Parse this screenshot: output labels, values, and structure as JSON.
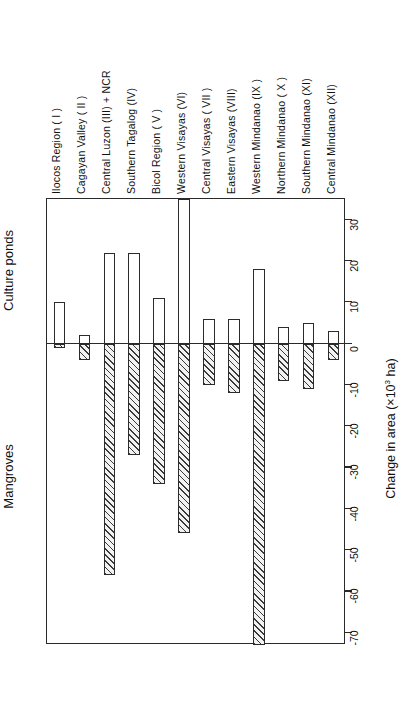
{
  "chart_data": {
    "type": "bar",
    "title": "",
    "subtitle": "",
    "xlabel": "",
    "ylabel": "Change in area (×10³ ha)",
    "ylabel_plain": "Change in area (x10^3 ha)",
    "ylim": [
      -73,
      35
    ],
    "grid": false,
    "legend_position": "none",
    "orientation": "vertical-bars-rotated-page",
    "zero_reference_line": 0,
    "tick_labels": [
      "30",
      "20",
      "10",
      "0",
      "-10",
      "-20",
      "-30",
      "-40",
      "-50",
      "-60",
      "-70"
    ],
    "tick_values": [
      30,
      20,
      10,
      0,
      -10,
      -20,
      -30,
      -40,
      -50,
      -60,
      -70
    ],
    "group_labels": {
      "positive": "Culture ponds",
      "negative": "Mangroves"
    },
    "categories": [
      "Ilocos Region ( I )",
      "Cagayan Valley ( II )",
      "Central Luzon (III) + NCR",
      "Southern Tagalog (IV)",
      "Bicol Region ( V )",
      "Western Visayas (VI)",
      "Central Visayas ( VII )",
      "Eastern Visayas (VIII)",
      "Western Mindanao (IX )",
      "Northern Mindanao ( X )",
      "Southern Mindanao (XI)",
      "Central Mindanao (XII)"
    ],
    "series": [
      {
        "name": "Culture ponds",
        "fill": "white",
        "values": [
          10,
          2,
          22,
          22,
          11,
          35,
          6,
          6,
          18,
          4,
          5,
          3
        ]
      },
      {
        "name": "Mangroves",
        "fill": "hatched",
        "values": [
          -1,
          -4,
          -56,
          -27,
          -34,
          -46,
          -10,
          -12,
          -73,
          -9,
          -11,
          -4
        ]
      }
    ]
  },
  "colors": {
    "ink": "#2a2a2a",
    "pond_fill": "#ffffff",
    "mangrove_hatch": "#3a3a3a"
  }
}
